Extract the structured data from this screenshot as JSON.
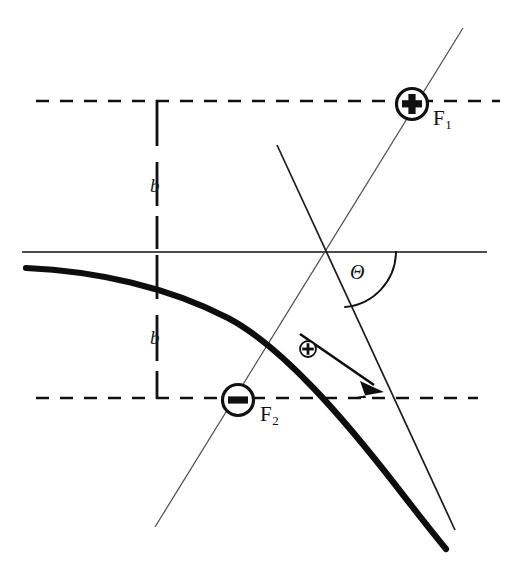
{
  "figure": {
    "background_color": "#ffffff",
    "ink_color": "#111111",
    "thin_line_color": "#5a5a5a",
    "width": 523,
    "height": 566
  },
  "labels": {
    "impact_parameter_upper": "b",
    "impact_parameter_lower": "b",
    "focus_one": "F",
    "focus_one_sub": "1",
    "focus_two": "F",
    "focus_two_sub": "2",
    "scattering_angle": "Θ",
    "charge_positive_glyph": "+",
    "charge_negative_glyph": "−",
    "particle_glyph": "+"
  },
  "caption": {
    "text": ""
  },
  "geometry": {
    "horizontal_axis": {
      "x1": 22,
      "y1": 252,
      "x2": 487,
      "y2": 252
    },
    "dashed_top": {
      "x1": 36,
      "y1": 101,
      "x2": 500,
      "y2": 101
    },
    "dashed_bottom": {
      "x1": 36,
      "y1": 398,
      "x2": 478,
      "y2": 398
    },
    "vertical_bracket": {
      "x": 157,
      "y_top": 100,
      "y_bottom": 399
    },
    "focus_one_circle": {
      "cx": 412,
      "cy": 104,
      "r": 16
    },
    "focus_two_circle": {
      "cx": 238,
      "cy": 400,
      "r": 16
    },
    "moving_charge_circle": {
      "cx": 308,
      "cy": 349,
      "r": 8
    },
    "asymptote_thin": {
      "x1": 155,
      "y1": 527,
      "x2": 463,
      "y2": 28
    },
    "steep_line": {
      "x1": 277,
      "y1": 145,
      "x2": 455,
      "y2": 530
    },
    "hyperbola_start": {
      "x": 26,
      "y": 268
    },
    "hyperbola_end": {
      "x": 446,
      "y": 548
    },
    "arrow_tip": {
      "x": 381,
      "y": 389
    },
    "angle_arc_radius": 56
  }
}
